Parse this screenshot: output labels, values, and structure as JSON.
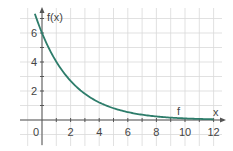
{
  "chart_data": {
    "type": "line",
    "title": "",
    "xlabel": "x",
    "ylabel": "f(x)",
    "xlim": [
      -1,
      12.5
    ],
    "ylim": [
      -1.5,
      7.5
    ],
    "grid": true,
    "x_ticks": [
      0,
      2,
      4,
      6,
      8,
      10,
      12
    ],
    "x_tick_labels": [
      "0",
      "2",
      "4",
      "6",
      "8",
      "10",
      "12"
    ],
    "y_ticks": [
      2,
      4,
      6
    ],
    "y_tick_labels": [
      "2",
      "4",
      "6"
    ],
    "series": [
      {
        "name": "f",
        "function": "6*exp(-0.4x)",
        "color": "#2e7d6b",
        "x": [
          -0.5,
          0,
          1,
          2,
          3,
          4,
          5,
          6,
          7,
          8,
          9,
          10,
          11,
          12
        ],
        "values": [
          7.33,
          6.0,
          4.02,
          2.7,
          1.81,
          1.21,
          0.81,
          0.54,
          0.37,
          0.24,
          0.16,
          0.11,
          0.07,
          0.05
        ]
      }
    ],
    "annotations": [
      {
        "text": "f",
        "x": 9.6,
        "y": 0.55
      }
    ]
  },
  "labels": {
    "y_axis": "f(x)",
    "x_axis": "x",
    "origin": "0",
    "curve": "f"
  },
  "colors": {
    "curve": "#2e7d6b",
    "grid": "#d9d9d9",
    "axis": "#555555"
  }
}
